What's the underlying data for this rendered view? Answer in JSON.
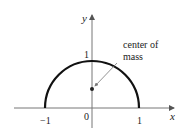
{
  "diagram": {
    "type": "semicircle-center-of-mass",
    "axes": {
      "x_label": "x",
      "y_label": "y",
      "x_ticks": [
        "−1",
        "0",
        "1"
      ],
      "y_ticks": [
        "1"
      ]
    },
    "curve": {
      "description": "upper half of unit circle",
      "radius": 1,
      "color": "#111111"
    },
    "annotation": {
      "line1": "center of",
      "line2": "mass"
    },
    "point": {
      "label": "center of mass",
      "x": 0,
      "y": 0.42
    }
  }
}
